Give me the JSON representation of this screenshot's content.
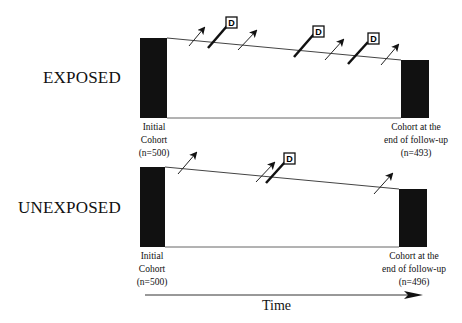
{
  "diagram": {
    "groups": [
      {
        "label": "EXPOSED",
        "initial": {
          "line1": "Initial",
          "line2": "Cohort",
          "line3": "(n=500)",
          "n": 500
        },
        "final": {
          "line1": "Cohort at the",
          "line2": "end of follow-up",
          "line3": "(n=493)",
          "n": 493
        },
        "loss_to_follow_up_arrows": 4,
        "disease_events": 3,
        "event_marker": "D"
      },
      {
        "label": "UNEXPOSED",
        "initial": {
          "line1": "Initial",
          "line2": "Cohort",
          "line3": "(n=500)",
          "n": 500
        },
        "final": {
          "line1": "Cohort at the",
          "line2": "end of follow-up",
          "line3": "(n=496)",
          "n": 496
        },
        "loss_to_follow_up_arrows": 3,
        "disease_events": 1,
        "event_marker": "D"
      }
    ],
    "axis": {
      "label": "Time",
      "icon": "arrow-right-icon"
    },
    "colors": {
      "bar": "#111111",
      "line": "#333333",
      "background": "#ffffff"
    }
  }
}
